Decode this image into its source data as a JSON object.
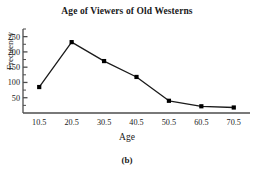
{
  "figure": {
    "caption": "(b)"
  },
  "chart_data": {
    "type": "line",
    "title": "Age of Viewers of Old Westerns",
    "xlabel": "Age",
    "ylabel": "Frequency",
    "categories": [
      "10.5",
      "20.5",
      "30.5",
      "40.5",
      "50.5",
      "60.5",
      "70.5"
    ],
    "x": [
      10.5,
      20.5,
      30.5,
      40.5,
      50.5,
      60.5,
      70.5
    ],
    "values": [
      85,
      232,
      170,
      118,
      40,
      22,
      18
    ],
    "series": [
      {
        "name": "Frequency",
        "values": [
          85,
          232,
          170,
          118,
          40,
          22,
          18
        ]
      }
    ],
    "xtick_labels": [
      "10.5",
      "20.5",
      "30.5",
      "40.5",
      "50.5",
      "60.5",
      "70.5"
    ],
    "ytick_labels": [
      "50",
      "100",
      "150",
      "200",
      "250"
    ],
    "yticks": [
      50,
      100,
      150,
      200,
      250
    ],
    "yminor_step": 25,
    "ylim": [
      0,
      275
    ],
    "xlim": [
      5.5,
      75.5
    ],
    "grid": false,
    "legend": false,
    "marker": "filled-square",
    "line_color": "#1a1a1a",
    "marker_color": "#000000",
    "axis_color": "#4d4d4d"
  }
}
